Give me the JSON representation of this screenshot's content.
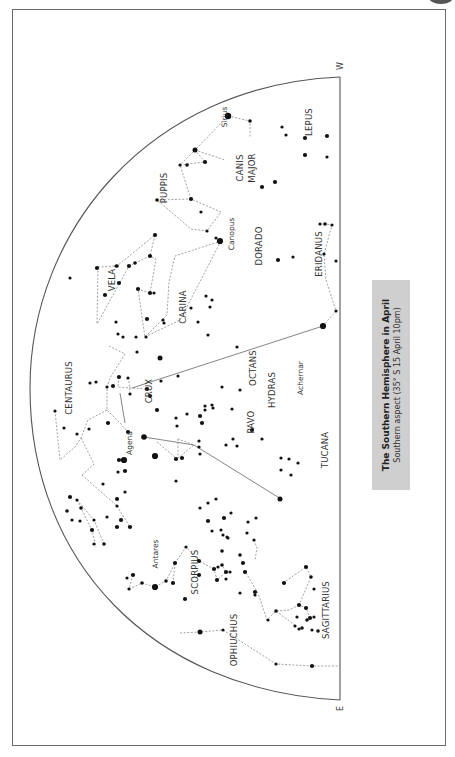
{
  "title": "The Southern Hemisphere in April",
  "subtitle": "Southern aspect (35° S 15 April 10pm)",
  "compass": {
    "west": "W",
    "east": "E"
  },
  "colors": {
    "frame": "#6b6b6b",
    "caption_bg": "#cfcfcf",
    "star": "#111111",
    "line": "#8a8a8a"
  },
  "constellations": [
    {
      "name": "LEPUS",
      "x": 312,
      "y": 122
    },
    {
      "name": "CANIS",
      "x": 243,
      "y": 168
    },
    {
      "name": "MAJOR",
      "x": 255,
      "y": 168
    },
    {
      "name": "PUPPIS",
      "x": 167,
      "y": 188
    },
    {
      "name": "VELA",
      "x": 115,
      "y": 280
    },
    {
      "name": "CARINA",
      "x": 186,
      "y": 307
    },
    {
      "name": "DORADO",
      "x": 262,
      "y": 246
    },
    {
      "name": "ERIDANUS",
      "x": 322,
      "y": 254
    },
    {
      "name": "HYDRAS",
      "x": 275,
      "y": 390
    },
    {
      "name": "OCTANS",
      "x": 256,
      "y": 368
    },
    {
      "name": "CRUX",
      "x": 152,
      "y": 391
    },
    {
      "name": "CENTAURUS",
      "x": 72,
      "y": 388
    },
    {
      "name": "PAVO",
      "x": 254,
      "y": 422
    },
    {
      "name": "TUCANA",
      "x": 328,
      "y": 450
    },
    {
      "name": "SCORPIUS",
      "x": 198,
      "y": 572
    },
    {
      "name": "SAGITTARIUS",
      "x": 329,
      "y": 610
    },
    {
      "name": "OPHIUCHUS",
      "x": 237,
      "y": 640
    }
  ],
  "star_names": [
    {
      "name": "Sirius",
      "x": 227,
      "y": 117
    },
    {
      "name": "Canopus",
      "x": 234,
      "y": 234
    },
    {
      "name": "Achernar",
      "x": 303,
      "y": 378
    },
    {
      "name": "Agena",
      "x": 132,
      "y": 443
    },
    {
      "name": "Antares",
      "x": 158,
      "y": 554
    }
  ],
  "stars": [
    [
      228,
      116,
      3.2
    ],
    [
      250,
      121,
      1.8
    ],
    [
      282,
      127,
      1.6
    ],
    [
      286,
      135,
      1.6
    ],
    [
      305,
      138,
      2.1
    ],
    [
      305,
      155,
      2.1
    ],
    [
      327,
      136,
      2.1
    ],
    [
      327,
      157,
      1.6
    ],
    [
      195,
      150,
      2.5
    ],
    [
      180,
      165,
      1.6
    ],
    [
      205,
      162,
      2.1
    ],
    [
      187,
      165,
      1.8
    ],
    [
      275,
      182,
      2.1
    ],
    [
      262,
      187,
      2.1
    ],
    [
      157,
      200,
      1.8
    ],
    [
      191,
      199,
      2.1
    ],
    [
      201,
      212,
      1.6
    ],
    [
      207,
      231,
      1.6
    ],
    [
      220,
      241,
      3.1
    ],
    [
      216,
      238,
      1.6
    ],
    [
      155,
      235,
      2.1
    ],
    [
      117,
      266,
      1.8
    ],
    [
      116,
      266,
      1.6
    ],
    [
      97,
      268,
      2.1
    ],
    [
      70,
      278,
      1.6
    ],
    [
      135,
      263,
      1.8
    ],
    [
      150,
      256,
      2.1
    ],
    [
      129,
      266,
      2.1
    ],
    [
      119,
      283,
      2.1
    ],
    [
      138,
      289,
      2.1
    ],
    [
      105,
      295,
      2.1
    ],
    [
      150,
      293,
      2.1
    ],
    [
      154,
      293,
      1.6
    ],
    [
      147,
      319,
      2.1
    ],
    [
      116,
      322,
      1.6
    ],
    [
      118,
      334,
      1.6
    ],
    [
      146,
      337,
      1.6
    ],
    [
      123,
      337,
      1.6
    ],
    [
      136,
      337,
      1.6
    ],
    [
      163,
      320,
      1.6
    ],
    [
      164,
      323,
      1.6
    ],
    [
      206,
      296,
      1.6
    ],
    [
      212,
      300,
      1.6
    ],
    [
      210,
      307,
      1.6
    ],
    [
      191,
      308,
      1.6
    ],
    [
      198,
      322,
      1.6
    ],
    [
      208,
      335,
      1.6
    ],
    [
      278,
      260,
      2.1
    ],
    [
      293,
      257,
      1.6
    ],
    [
      320,
      224,
      1.6
    ],
    [
      325,
      224,
      1.8
    ],
    [
      332,
      225,
      1.6
    ],
    [
      324,
      254,
      1.6
    ],
    [
      336,
      261,
      1.6
    ],
    [
      336,
      311,
      1.6
    ],
    [
      323,
      326,
      3.1
    ],
    [
      237,
      347,
      1.6
    ],
    [
      240,
      390,
      1.6
    ],
    [
      213,
      408,
      1.6
    ],
    [
      160,
      358,
      2.5
    ],
    [
      137,
      352,
      1.6
    ],
    [
      161,
      381,
      1.6
    ],
    [
      119,
      377,
      2.1
    ],
    [
      150,
      396,
      2.1
    ],
    [
      128,
      378,
      1.6
    ],
    [
      147,
      389,
      2.1
    ],
    [
      130,
      394,
      1.6
    ],
    [
      113,
      386,
      2.1
    ],
    [
      107,
      387,
      1.6
    ],
    [
      178,
      376,
      1.6
    ],
    [
      205,
      410,
      1.6
    ],
    [
      222,
      387,
      1.6
    ],
    [
      232,
      409,
      1.6
    ],
    [
      90,
      383,
      1.6
    ],
    [
      96,
      382,
      1.6
    ],
    [
      55,
      411,
      1.6
    ],
    [
      64,
      428,
      1.6
    ],
    [
      89,
      429,
      1.6
    ],
    [
      77,
      434,
      1.6
    ],
    [
      108,
      423,
      2.1
    ],
    [
      128,
      432,
      2.1
    ],
    [
      119,
      460,
      2.1
    ],
    [
      144,
      437,
      2.8
    ],
    [
      155,
      456,
      3.1
    ],
    [
      124,
      460,
      3.1
    ],
    [
      176,
      459,
      2.1
    ],
    [
      157,
      410,
      2.1
    ],
    [
      176,
      418,
      1.6
    ],
    [
      177,
      426,
      1.6
    ],
    [
      187,
      414,
      1.6
    ],
    [
      199,
      441,
      1.6
    ],
    [
      199,
      447,
      1.6
    ],
    [
      200,
      454,
      1.6
    ],
    [
      205,
      406,
      1.6
    ],
    [
      212,
      405,
      1.6
    ],
    [
      200,
      416,
      2.1
    ],
    [
      202,
      423,
      2.1
    ],
    [
      176,
      481,
      1.6
    ],
    [
      182,
      458,
      2.1
    ],
    [
      233,
      439,
      1.6
    ],
    [
      237,
      446,
      1.6
    ],
    [
      226,
      445,
      1.6
    ],
    [
      252,
      430,
      2.1
    ],
    [
      280,
      499,
      2.5
    ],
    [
      262,
      439,
      1.6
    ],
    [
      281,
      470,
      1.6
    ],
    [
      291,
      475,
      1.6
    ],
    [
      289,
      459,
      1.6
    ],
    [
      298,
      463,
      1.6
    ],
    [
      281,
      458,
      1.6
    ],
    [
      70,
      497,
      2.1
    ],
    [
      77,
      500,
      1.6
    ],
    [
      67,
      511,
      1.8
    ],
    [
      72,
      520,
      1.6
    ],
    [
      81,
      508,
      1.8
    ],
    [
      80,
      521,
      1.6
    ],
    [
      94,
      520,
      1.6
    ],
    [
      118,
      472,
      1.6
    ],
    [
      125,
      492,
      1.6
    ],
    [
      103,
      484,
      1.6
    ],
    [
      117,
      499,
      2.1
    ],
    [
      117,
      506,
      1.6
    ],
    [
      125,
      471,
      2.1
    ],
    [
      92,
      530,
      2.1
    ],
    [
      94,
      544,
      1.6
    ],
    [
      104,
      544,
      1.8
    ],
    [
      107,
      517,
      1.6
    ],
    [
      117,
      527,
      2.1
    ],
    [
      121,
      520,
      2.1
    ],
    [
      130,
      527,
      2.1
    ],
    [
      200,
      508,
      1.6
    ],
    [
      208,
      503,
      1.6
    ],
    [
      216,
      499,
      1.6
    ],
    [
      208,
      521,
      2.1
    ],
    [
      212,
      531,
      1.6
    ],
    [
      223,
      535,
      1.6
    ],
    [
      224,
      518,
      2.1
    ],
    [
      221,
      530,
      1.6
    ],
    [
      231,
      513,
      1.6
    ],
    [
      228,
      538,
      1.6
    ],
    [
      248,
      522,
      1.6
    ],
    [
      256,
      518,
      1.6
    ],
    [
      247,
      533,
      1.6
    ],
    [
      254,
      540,
      1.6
    ],
    [
      133,
      575,
      2.1
    ],
    [
      127,
      578,
      1.6
    ],
    [
      129,
      589,
      1.6
    ],
    [
      142,
      583,
      1.8
    ],
    [
      155,
      587,
      3.1
    ],
    [
      166,
      581,
      1.8
    ],
    [
      175,
      563,
      2.1
    ],
    [
      173,
      583,
      2.1
    ],
    [
      186,
      547,
      1.6
    ],
    [
      199,
      561,
      2.1
    ],
    [
      199,
      575,
      2.1
    ],
    [
      185,
      599,
      2.1
    ],
    [
      214,
      569,
      2.1
    ],
    [
      218,
      567,
      1.6
    ],
    [
      222,
      565,
      1.8
    ],
    [
      226,
      572,
      2.1
    ],
    [
      217,
      580,
      2.1
    ],
    [
      226,
      579,
      1.6
    ],
    [
      227,
      537,
      1.6
    ],
    [
      222,
      551,
      1.8
    ],
    [
      243,
      563,
      2.1
    ],
    [
      240,
      555,
      1.8
    ],
    [
      245,
      572,
      2.1
    ],
    [
      230,
      572,
      1.6
    ],
    [
      240,
      593,
      1.6
    ],
    [
      255,
      592,
      2.1
    ],
    [
      255,
      595,
      1.6
    ],
    [
      268,
      620,
      1.6
    ],
    [
      276,
      611,
      1.8
    ],
    [
      295,
      626,
      1.6
    ],
    [
      284,
      583,
      2.1
    ],
    [
      306,
      567,
      2.1
    ],
    [
      311,
      577,
      1.8
    ],
    [
      314,
      589,
      1.6
    ],
    [
      299,
      605,
      2.1
    ],
    [
      306,
      608,
      2.1
    ],
    [
      310,
      618,
      2.1
    ],
    [
      297,
      617,
      1.6
    ],
    [
      307,
      620,
      1.8
    ],
    [
      314,
      617,
      1.6
    ],
    [
      302,
      628,
      1.8
    ],
    [
      312,
      630,
      1.6
    ],
    [
      318,
      631,
      1.8
    ],
    [
      299,
      629,
      1.6
    ],
    [
      200,
      632,
      2.5
    ],
    [
      223,
      630,
      1.6
    ],
    [
      276,
      664,
      1.6
    ],
    [
      312,
      666,
      2.1
    ]
  ]
}
